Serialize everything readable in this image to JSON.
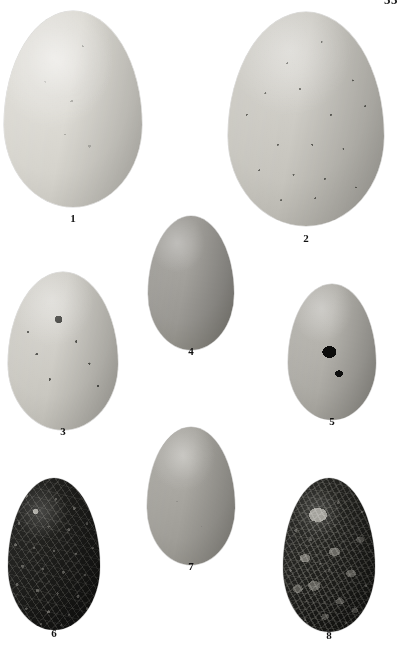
{
  "plate": {
    "folio": "55",
    "background_color": "#ffffff",
    "width": 404,
    "height": 654
  },
  "figures": [
    {
      "caption": "1",
      "description": "plain unmarked pale egg, largest in plate",
      "pattern": "unmarked",
      "ground_color": "#dddbd5",
      "mark_color": "#5a5a55"
    },
    {
      "caption": "2",
      "description": "large egg densely covered with fine dark speckling",
      "pattern": "dense-fine-speckles",
      "ground_color": "#c6c4bd",
      "mark_color": "#43433f"
    },
    {
      "caption": "3",
      "description": "pale grey egg with scattered dark blotches and spots",
      "pattern": "scattered-blotches",
      "ground_color": "#c9c7c0",
      "mark_color": "#33332f"
    },
    {
      "caption": "4",
      "description": "mid grey egg heavily marked with large black blotches",
      "pattern": "large-black-blotches",
      "ground_color": "#9a9893",
      "mark_color": "#111110"
    },
    {
      "caption": "5",
      "description": "grey egg with scattered black spots and one large central blotch",
      "pattern": "spotted-with-central-blotch",
      "ground_color": "#acaaa4",
      "mark_color": "#141413"
    },
    {
      "caption": "6",
      "description": "near-black egg overlaid with fine pale scrawl markings",
      "pattern": "dark-with-pale-scrawl",
      "ground_color": "#1a1a18",
      "mark_color": "#a8a69e"
    },
    {
      "caption": "7",
      "description": "plain unmarked mid grey egg",
      "pattern": "unmarked",
      "ground_color": "#a09e98",
      "mark_color": "#50504c"
    },
    {
      "caption": "8",
      "description": "near-black egg with heavy pale mottling and blotches",
      "pattern": "dark-heavy-mottle",
      "ground_color": "#1d1d1a",
      "mark_color": "#b0aea6"
    }
  ]
}
